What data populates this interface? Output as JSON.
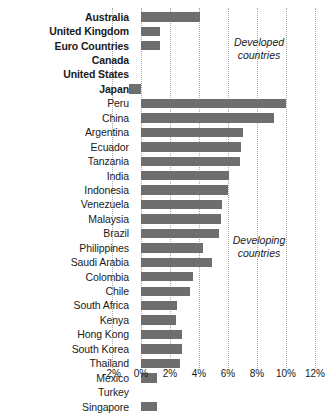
{
  "chart_data": {
    "type": "bar",
    "orientation": "horizontal",
    "title": "",
    "xlabel": "",
    "ylabel": "",
    "xlim": [
      -2,
      12
    ],
    "grid": true,
    "grid_axis": "x",
    "bar_color": "#6e6e6e",
    "xticks": [
      -2,
      0,
      2,
      4,
      6,
      8,
      10,
      12
    ],
    "xtick_labels": [
      "-2%",
      "0%",
      "2%",
      "4%",
      "6%",
      "8%",
      "10%",
      "12%"
    ],
    "categories": [
      "Australia",
      "United Kingdom",
      "Euro Countries",
      "Canada",
      "United States",
      "Japan",
      "Peru",
      "China",
      "Argentina",
      "Ecuador",
      "Tanzania",
      "India",
      "Indonesia",
      "Venezuela",
      "Malaysia",
      "Brazil",
      "Philippines",
      "Saudi Arabia",
      "Colombia",
      "Chile",
      "South Africa",
      "Kenya",
      "Hong Kong",
      "South Korea",
      "Thailand",
      "Mexico",
      "Turkey",
      "Singapore"
    ],
    "values": [
      4.1,
      1.3,
      1.3,
      0.0,
      0.0,
      -0.8,
      10.0,
      9.2,
      7.0,
      6.9,
      6.8,
      6.1,
      6.0,
      5.6,
      5.5,
      5.4,
      4.3,
      4.9,
      3.6,
      3.4,
      2.5,
      2.4,
      2.8,
      2.8,
      2.7,
      1.1,
      0.0,
      1.1
    ],
    "groups": [
      {
        "name": "Developed countries",
        "label_text": "Developed\ncountries",
        "members": [
          "Australia",
          "United Kingdom",
          "Euro Countries",
          "Canada",
          "United States",
          "Japan"
        ],
        "bold_labels": true
      },
      {
        "name": "Developing countries",
        "label_text": "Developing\ncountries",
        "members": [
          "Peru",
          "China",
          "Argentina",
          "Ecuador",
          "Tanzania",
          "India",
          "Indonesia",
          "Venezuela",
          "Malaysia",
          "Brazil",
          "Philippines",
          "Saudi Arabia",
          "Colombia",
          "Chile",
          "South Africa",
          "Kenya",
          "Hong Kong",
          "South Korea",
          "Thailand",
          "Mexico",
          "Turkey",
          "Singapore"
        ],
        "bold_labels": false
      }
    ],
    "annotations": [
      {
        "text": "Developed\ncountries",
        "x": 7.5,
        "y_category": "Euro Countries"
      },
      {
        "text": "Developing\ncountries",
        "x": 7.5,
        "y_category": "Colombia"
      }
    ]
  }
}
